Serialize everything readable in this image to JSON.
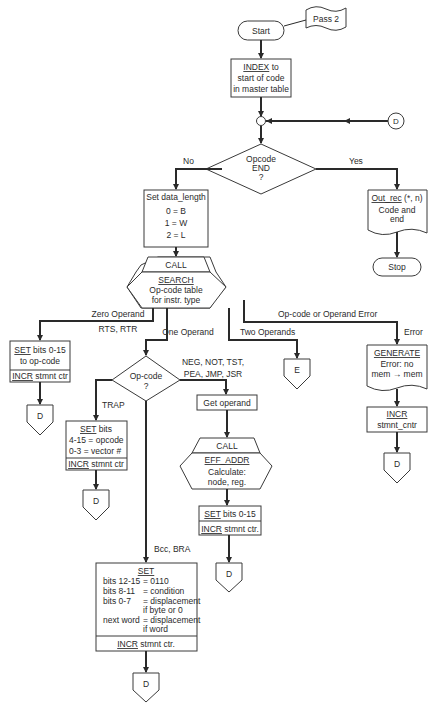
{
  "flowchart": {
    "terminals": {
      "start": "Start",
      "stop": "Stop"
    },
    "annotation": "Pass 2",
    "index_box": {
      "keyword": "INDEX",
      "line1_rest": " to",
      "line2": "start of code",
      "line3": "in master table"
    },
    "connector_top": "D",
    "decision_end": {
      "line1": "Opcode",
      "line2": "END",
      "line3": "?"
    },
    "labels": {
      "no": "No",
      "yes": "Yes",
      "zero_operand": "Zero Operand",
      "rts_rtr": "RTS, RTR",
      "one_operand": "One Operand",
      "two_operands": "Two Operands",
      "opcode_error": "Op-code or Operand Error",
      "error": "Error",
      "neg_group_1": "NEG, NOT, TST,",
      "neg_group_2": "PEA, JMP, JSR",
      "trap": "TRAP",
      "bcc": "Bcc, BRA"
    },
    "out_rec": {
      "keyword": "Out_rec",
      "args": " (*, n)",
      "line2": "Code and",
      "line3": "end"
    },
    "set_data_length": {
      "title": "Set data_length",
      "lines": [
        "0 = B",
        "1 = W",
        "2 = L"
      ]
    },
    "call_search": {
      "call": "CALL",
      "keyword": "SEARCH",
      "line2": "Op-code table",
      "line3": "for instr. type"
    },
    "zero_box": {
      "keyword": "SET",
      "rest": " bits 0-15",
      "line2": "to op-code",
      "incr": "INCR",
      "incr_rest": " stmnt ctr"
    },
    "decision_opcode": {
      "line1": "Op-code",
      "line2": "?"
    },
    "trap_box": {
      "keyword": "SET",
      "rest": " bits",
      "line2": "4-15 = opcode",
      "line3": "0-3   = vector #",
      "incr": "INCR",
      "incr_rest": " stmnt ctr"
    },
    "get_operand": "Get operand",
    "call_eff": {
      "call": "CALL",
      "keyword": "EFF_ADDR",
      "line2": "Calculate:",
      "line3": "node, reg."
    },
    "set_box2": {
      "keyword": "SET",
      "rest": " bits 0-15",
      "incr": "INCR",
      "incr_rest": " stmnt ctr."
    },
    "generate": {
      "keyword": "GENERATE",
      "line2": "Error:  no",
      "line3": "mem → mem"
    },
    "incr_cntr": {
      "keyword": "INCR",
      "line2": "stmnt_cntr"
    },
    "bcc_box": {
      "keyword": "SET",
      "rows": [
        [
          "bits 12-15",
          "= 0110"
        ],
        [
          "bits   8-11",
          "= condition"
        ],
        [
          "bits   0-7",
          "= displacement"
        ],
        [
          "",
          "  if byte or 0"
        ],
        [
          "next word",
          "= displacement"
        ],
        [
          "",
          "  if word"
        ]
      ],
      "incr": "INCR",
      "incr_rest": " stmnt ctr."
    },
    "offpage": {
      "d": "D",
      "e": "E"
    }
  }
}
